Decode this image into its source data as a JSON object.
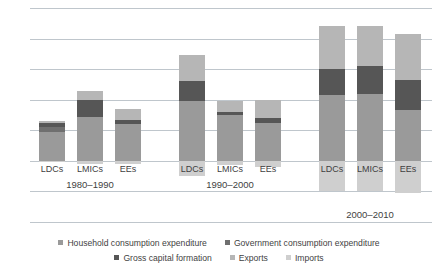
{
  "chart_data": {
    "type": "bar",
    "title": "",
    "subtitle": "",
    "xlabel": "",
    "ylabel": "",
    "ylim": [
      -4,
      10
    ],
    "yticks": [
      10,
      8,
      6,
      4,
      2,
      0,
      -2,
      -4
    ],
    "ytick_labels": [
      "10",
      "8",
      "6",
      "4",
      "2",
      "0",
      "–2",
      "–4"
    ],
    "grid": true,
    "stacked": true,
    "legend_position": "bottom",
    "groups": [
      {
        "period": "1980–1990",
        "categories": [
          "LDCs",
          "LMICs",
          "EEs"
        ]
      },
      {
        "period": "1990–2000",
        "categories": [
          "LDCs",
          "LMICs",
          "EEs"
        ]
      },
      {
        "period": "2000–2010",
        "categories": [
          "LDCs",
          "LMICs",
          "EEs"
        ]
      }
    ],
    "series": [
      {
        "name": "Household consumption expenditure",
        "color": "#9a9a9a",
        "values": [
          1.9,
          2.4,
          2.1,
          1.7,
          2.6,
          2.3,
          3.9,
          4.0,
          3.0
        ]
      },
      {
        "name": "Government consumption expenditure",
        "color": "#6f6f6f",
        "values": [
          0.3,
          0.5,
          0.3,
          0.3,
          0.2,
          0.2,
          0.4,
          0.4,
          0.3
        ]
      },
      {
        "name": "Gross capital formation",
        "color": "#565656",
        "values": [
          0.3,
          1.1,
          0.2,
          1.3,
          0.2,
          0.2,
          1.7,
          1.8,
          2.0
        ]
      },
      {
        "name": "Exports",
        "color": "#b6b6b6",
        "values": [
          0.1,
          0.6,
          0.8,
          1.7,
          0.9,
          1.3,
          2.8,
          2.6,
          3.0
        ]
      },
      {
        "name": "Imports",
        "color": "#cfcfcf",
        "values": [
          -0.1,
          -0.2,
          -0.2,
          -1.0,
          -0.3,
          -0.4,
          -2.0,
          -2.0,
          -2.1
        ]
      }
    ],
    "bar_stacks": [
      {
        "group": 0,
        "category": "LDCs",
        "positive": [
          {
            "series": "Household consumption expenditure",
            "from": 0,
            "to": 1.9
          },
          {
            "series": "Government consumption expenditure",
            "from": 1.9,
            "to": 2.2
          },
          {
            "series": "Gross capital formation",
            "from": 2.2,
            "to": 2.5
          },
          {
            "series": "Exports",
            "from": 2.5,
            "to": 2.6
          }
        ],
        "negative": [
          {
            "series": "Imports",
            "from": 0,
            "to": -0.1
          }
        ],
        "total": 2.5
      },
      {
        "group": 0,
        "category": "LMICs",
        "positive": [
          {
            "series": "Household consumption expenditure",
            "from": 0,
            "to": 2.9
          },
          {
            "series": "Gross capital formation",
            "from": 2.9,
            "to": 4.0
          },
          {
            "series": "Exports",
            "from": 4.0,
            "to": 4.6
          }
        ],
        "negative": [
          {
            "series": "Imports",
            "from": 0,
            "to": -0.2
          }
        ],
        "total": 4.6
      },
      {
        "group": 0,
        "category": "EEs",
        "positive": [
          {
            "series": "Household consumption expenditure",
            "from": 0,
            "to": 2.4
          },
          {
            "series": "Gross capital formation",
            "from": 2.4,
            "to": 2.7
          },
          {
            "series": "Exports",
            "from": 2.7,
            "to": 3.4
          }
        ],
        "negative": [
          {
            "series": "Imports",
            "from": 0,
            "to": -0.2
          }
        ],
        "total": 3.4
      },
      {
        "group": 1,
        "category": "LDCs",
        "positive": [
          {
            "series": "Household consumption expenditure",
            "from": 0,
            "to": 3.9
          },
          {
            "series": "Gross capital formation",
            "from": 3.9,
            "to": 5.2
          },
          {
            "series": "Exports",
            "from": 5.2,
            "to": 6.9
          }
        ],
        "negative": [
          {
            "series": "Imports",
            "from": 0,
            "to": -1.0
          }
        ],
        "total": 6.9
      },
      {
        "group": 1,
        "category": "LMICs",
        "positive": [
          {
            "series": "Household consumption expenditure",
            "from": 0,
            "to": 3.0
          },
          {
            "series": "Gross capital formation",
            "from": 3.0,
            "to": 3.2
          },
          {
            "series": "Exports",
            "from": 3.2,
            "to": 3.9
          }
        ],
        "negative": [
          {
            "series": "Imports",
            "from": 0,
            "to": -0.3
          }
        ],
        "total": 3.9
      },
      {
        "group": 1,
        "category": "EEs",
        "positive": [
          {
            "series": "Household consumption expenditure",
            "from": 0,
            "to": 2.5
          },
          {
            "series": "Gross capital formation",
            "from": 2.5,
            "to": 2.8
          },
          {
            "series": "Exports",
            "from": 2.8,
            "to": 4.0
          }
        ],
        "negative": [
          {
            "series": "Imports",
            "from": 0,
            "to": -0.4
          }
        ],
        "total": 4.0
      },
      {
        "group": 2,
        "category": "LDCs",
        "positive": [
          {
            "series": "Household consumption expenditure",
            "from": 0,
            "to": 4.3
          },
          {
            "series": "Gross capital formation",
            "from": 4.3,
            "to": 6.0
          },
          {
            "series": "Exports",
            "from": 6.0,
            "to": 8.8
          }
        ],
        "negative": [
          {
            "series": "Imports",
            "from": 0,
            "to": -2.0
          }
        ],
        "total": 8.8
      },
      {
        "group": 2,
        "category": "LMICs",
        "positive": [
          {
            "series": "Household consumption expenditure",
            "from": 0,
            "to": 4.4
          },
          {
            "series": "Gross capital formation",
            "from": 4.4,
            "to": 6.2
          },
          {
            "series": "Exports",
            "from": 6.2,
            "to": 8.8
          }
        ],
        "negative": [
          {
            "series": "Imports",
            "from": 0,
            "to": -2.0
          }
        ],
        "total": 8.8
      },
      {
        "group": 2,
        "category": "EEs",
        "positive": [
          {
            "series": "Household consumption expenditure",
            "from": 0,
            "to": 3.3
          },
          {
            "series": "Gross capital formation",
            "from": 3.3,
            "to": 5.3
          },
          {
            "series": "Exports",
            "from": 5.3,
            "to": 8.3
          }
        ],
        "negative": [
          {
            "series": "Imports",
            "from": 0,
            "to": -2.1
          }
        ],
        "total": 8.3
      }
    ],
    "legend": [
      {
        "label": "Household consumption expenditure",
        "color": "#9a9a9a"
      },
      {
        "label": "Government consumption expenditure",
        "color": "#6f6f6f"
      },
      {
        "label": "Gross capital formation",
        "color": "#565656"
      },
      {
        "label": "Exports",
        "color": "#b6b6b6"
      },
      {
        "label": "Imports",
        "color": "#cfcfcf"
      }
    ]
  }
}
